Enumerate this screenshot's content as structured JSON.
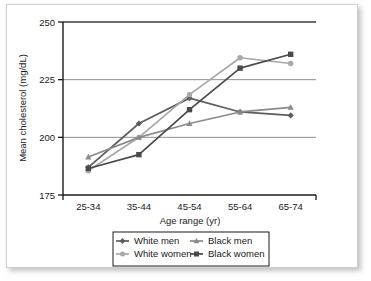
{
  "chart_data": {
    "type": "line",
    "title": "",
    "xlabel": "Age range (yr)",
    "ylabel": "Mean cholesterol (mg/dL)",
    "categories": [
      "25-34",
      "35-44",
      "45-54",
      "55-64",
      "65-74"
    ],
    "ylim": [
      175,
      250
    ],
    "yticks": [
      175,
      200,
      225,
      250
    ],
    "ytick_labels": [
      "175",
      "200",
      "225",
      "250"
    ],
    "grid": "horizontal",
    "legend_position": "bottom",
    "series": [
      {
        "name": "White men",
        "color": "#5d5d5d",
        "marker": "diamond",
        "values": [
          187,
          206,
          217,
          211,
          209.5
        ]
      },
      {
        "name": "White women",
        "color": "#a8a8a8",
        "marker": "circle",
        "values": [
          185.5,
          200,
          218.5,
          234.5,
          232
        ]
      },
      {
        "name": "Black men",
        "color": "#8a8a8a",
        "marker": "triangle",
        "values": [
          191.5,
          200,
          206,
          211,
          213
        ]
      },
      {
        "name": "Black women",
        "color": "#4a4a4a",
        "marker": "square",
        "values": [
          186.5,
          192.5,
          212,
          230,
          236
        ]
      }
    ]
  },
  "legend": {
    "entries": [
      {
        "label": "White men"
      },
      {
        "label": "Black men"
      },
      {
        "label": "White women"
      },
      {
        "label": "Black women"
      }
    ]
  }
}
